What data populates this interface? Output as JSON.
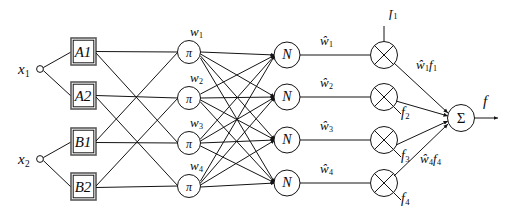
{
  "diagram": {
    "type": "neuro-fuzzy-network",
    "colors": {
      "stroke": "#141414",
      "background": "#ffffff",
      "text": "#0b0b0b"
    },
    "inputs": [
      {
        "id": "x1",
        "label": "x",
        "sub": "1",
        "x": 22,
        "y": 70
      },
      {
        "id": "x2",
        "label": "x",
        "sub": "2",
        "x": 22,
        "y": 160
      }
    ],
    "membership_boxes": [
      {
        "id": "A1",
        "label": "A",
        "sub": "1",
        "cx": 83,
        "cy": 52
      },
      {
        "id": "A2",
        "label": "A",
        "sub": "2",
        "cx": 83,
        "cy": 96
      },
      {
        "id": "B1",
        "label": "B",
        "sub": "1",
        "cx": 83,
        "cy": 142
      },
      {
        "id": "B2",
        "label": "B",
        "sub": "2",
        "cx": 83,
        "cy": 187
      }
    ],
    "rule_nodes": [
      {
        "id": "pi1",
        "symbol": "π",
        "cx": 189,
        "cy": 52
      },
      {
        "id": "pi2",
        "symbol": "π",
        "cx": 189,
        "cy": 98
      },
      {
        "id": "pi3",
        "symbol": "π",
        "cx": 189,
        "cy": 143
      },
      {
        "id": "pi4",
        "symbol": "π",
        "cx": 189,
        "cy": 186
      }
    ],
    "rule_weights": [
      {
        "id": "w1",
        "label": "w",
        "sub": "1",
        "x": 196,
        "y": 33
      },
      {
        "id": "w2",
        "label": "w",
        "sub": "2",
        "x": 196,
        "y": 80
      },
      {
        "id": "w3",
        "label": "w",
        "sub": "3",
        "x": 196,
        "y": 124
      },
      {
        "id": "w4",
        "label": "w",
        "sub": "4",
        "x": 196,
        "y": 166
      }
    ],
    "norm_nodes": [
      {
        "id": "N1",
        "symbol": "N",
        "cx": 287,
        "cy": 55
      },
      {
        "id": "N2",
        "symbol": "N",
        "cx": 287,
        "cy": 97
      },
      {
        "id": "N3",
        "symbol": "N",
        "cx": 287,
        "cy": 140
      },
      {
        "id": "N4",
        "symbol": "N",
        "cx": 287,
        "cy": 183
      }
    ],
    "normalized_weights": [
      {
        "id": "wn1",
        "label": "ŵ",
        "sub": "1",
        "x": 324,
        "y": 42
      },
      {
        "id": "wn2",
        "label": "ŵ",
        "sub": "2",
        "x": 324,
        "y": 84
      },
      {
        "id": "wn3",
        "label": "ŵ",
        "sub": "3",
        "x": 324,
        "y": 127
      },
      {
        "id": "wn4",
        "label": "ŵ",
        "sub": "4",
        "x": 324,
        "y": 170
      }
    ],
    "product_nodes": [
      {
        "id": "mul1",
        "symbol": "⊗",
        "cx": 384,
        "cy": 55
      },
      {
        "id": "mul2",
        "symbol": "⊗",
        "cx": 384,
        "cy": 97
      },
      {
        "id": "mul3",
        "symbol": "⊗",
        "cx": 384,
        "cy": 140
      },
      {
        "id": "mul4",
        "symbol": "⊗",
        "cx": 384,
        "cy": 183
      }
    ],
    "consequent_inputs": [
      {
        "id": "f1",
        "label": "f",
        "sub": "1",
        "x": 392,
        "y": 13
      },
      {
        "id": "f2",
        "label": "f",
        "sub": "2",
        "x": 405,
        "y": 112
      },
      {
        "id": "f3",
        "label": "f",
        "sub": "3",
        "x": 405,
        "y": 155
      },
      {
        "id": "f4",
        "label": "f",
        "sub": "4",
        "x": 405,
        "y": 198
      }
    ],
    "product_labels": [
      {
        "id": "wf1",
        "label": "ŵ",
        "sub": "1",
        "label2": "f",
        "sub2": "1",
        "x": 420,
        "y": 66
      },
      {
        "id": "wf4",
        "label": "ŵ",
        "sub": "4",
        "label2": "f",
        "sub2": "4",
        "x": 424,
        "y": 160
      }
    ],
    "sum_node": {
      "id": "sum",
      "symbol": "Σ",
      "cx": 461,
      "cy": 118
    },
    "output": {
      "id": "f",
      "label": "f",
      "x": 486,
      "y": 102
    }
  }
}
